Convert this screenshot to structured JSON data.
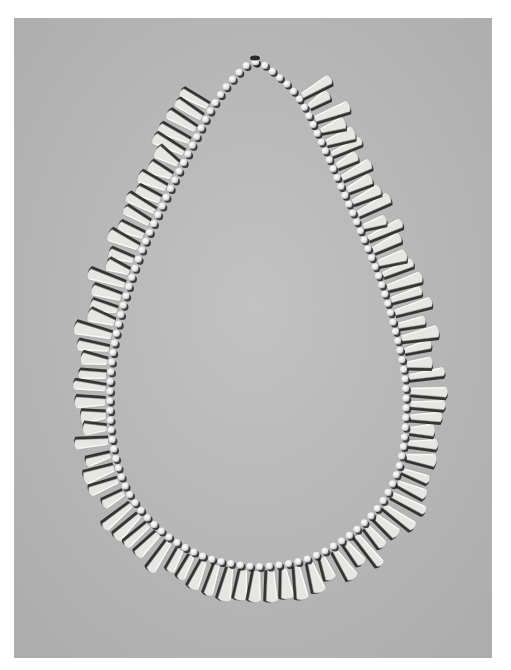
{
  "image": {
    "subject": "Necklace of white beads with pendant teeth arranged in a teardrop loop on a gray background",
    "style": "black-and-white photograph",
    "border_color": "#ffffff",
    "background_color": "#b9b9b9",
    "bead_color": "#ececec",
    "tooth_color": "#e6e6e2",
    "shadow_color": "#1c1c1c"
  },
  "necklace": {
    "apex": [
      255,
      62
    ],
    "inner_string": {
      "left_points": [
        [
          255,
          62
        ],
        [
          232,
          80
        ],
        [
          212,
          108
        ],
        [
          190,
          150
        ],
        [
          165,
          200
        ],
        [
          140,
          255
        ],
        [
          122,
          310
        ],
        [
          112,
          360
        ],
        [
          110,
          410
        ],
        [
          115,
          455
        ],
        [
          130,
          495
        ],
        [
          160,
          530
        ],
        [
          200,
          555
        ],
        [
          240,
          565
        ]
      ],
      "right_points": [
        [
          255,
          62
        ],
        [
          280,
          78
        ],
        [
          300,
          100
        ],
        [
          318,
          135
        ],
        [
          338,
          180
        ],
        [
          360,
          230
        ],
        [
          380,
          280
        ],
        [
          395,
          330
        ],
        [
          405,
          380
        ],
        [
          405,
          430
        ],
        [
          398,
          470
        ],
        [
          380,
          505
        ],
        [
          350,
          535
        ],
        [
          310,
          558
        ],
        [
          270,
          566
        ]
      ]
    },
    "bead_count_estimate": 130,
    "tooth_count_estimate": 95
  }
}
